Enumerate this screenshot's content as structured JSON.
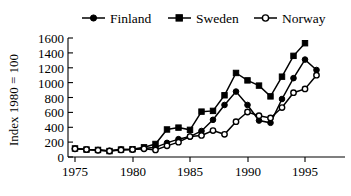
{
  "chart_data": {
    "type": "line",
    "title": "",
    "xlabel": "",
    "ylabel": "Index 1980 = 100",
    "xlim": [
      1975,
      1996
    ],
    "ylim": [
      0,
      1600
    ],
    "yticks": [
      0,
      200,
      400,
      600,
      800,
      1000,
      1200,
      1400,
      1600
    ],
    "xticks": [
      1975,
      1980,
      1985,
      1990,
      1995
    ],
    "grid": false,
    "legend_position": "top",
    "x": [
      1975,
      1976,
      1977,
      1978,
      1979,
      1980,
      1981,
      1982,
      1983,
      1984,
      1985,
      1986,
      1987,
      1988,
      1989,
      1990,
      1991,
      1992,
      1993,
      1994,
      1995,
      1996
    ],
    "series": [
      {
        "name": "Finland",
        "marker": "filled-circle",
        "values": [
          110,
          100,
          95,
          85,
          100,
          100,
          115,
          130,
          190,
          240,
          275,
          350,
          500,
          700,
          880,
          700,
          490,
          460,
          780,
          1060,
          1310,
          1170
        ]
      },
      {
        "name": "Sweden",
        "marker": "filled-square",
        "values": [
          115,
          100,
          95,
          80,
          100,
          105,
          130,
          175,
          370,
          395,
          365,
          610,
          620,
          830,
          1130,
          1030,
          960,
          815,
          1080,
          1360,
          1530,
          null
        ]
      },
      {
        "name": "Norway",
        "marker": "open-circle",
        "values": [
          110,
          100,
          90,
          80,
          95,
          100,
          110,
          95,
          150,
          200,
          275,
          290,
          355,
          305,
          475,
          605,
          555,
          525,
          665,
          865,
          915,
          1100
        ]
      }
    ]
  },
  "legend": {
    "items": [
      {
        "label": "Finland",
        "marker": "filled-circle"
      },
      {
        "label": "Sweden",
        "marker": "filled-square"
      },
      {
        "label": "Norway",
        "marker": "open-circle"
      }
    ]
  },
  "axes": {
    "y_title": "Index 1980 = 100",
    "y_tick_labels": [
      "1600",
      "1400",
      "1200",
      "1000",
      "800",
      "600",
      "400",
      "200",
      "0"
    ],
    "x_tick_labels": [
      "1975",
      "1980",
      "1985",
      "1990",
      "1995"
    ]
  },
  "colors": {
    "ink": "#000000",
    "background": "#ffffff"
  }
}
